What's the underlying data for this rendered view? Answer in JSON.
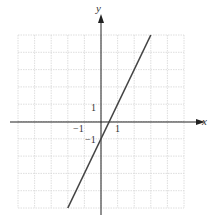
{
  "chart_data": {
    "type": "line",
    "title": "",
    "xlabel": "x",
    "ylabel": "y",
    "xlim": [
      -5,
      5
    ],
    "ylim": [
      -5,
      5
    ],
    "grid": true,
    "tick_labels": {
      "x": [
        "-1",
        "1"
      ],
      "y": [
        "1",
        "-1"
      ]
    },
    "series": [
      {
        "name": "y = 2x - 1",
        "x": [
          -2,
          3
        ],
        "y": [
          -5,
          5
        ],
        "color": "#444444"
      }
    ]
  },
  "labels": {
    "x_axis": "x",
    "y_axis": "y",
    "x_tick_neg1": "−1",
    "x_tick_1": "1",
    "y_tick_1": "1",
    "y_tick_neg1": "−1"
  }
}
